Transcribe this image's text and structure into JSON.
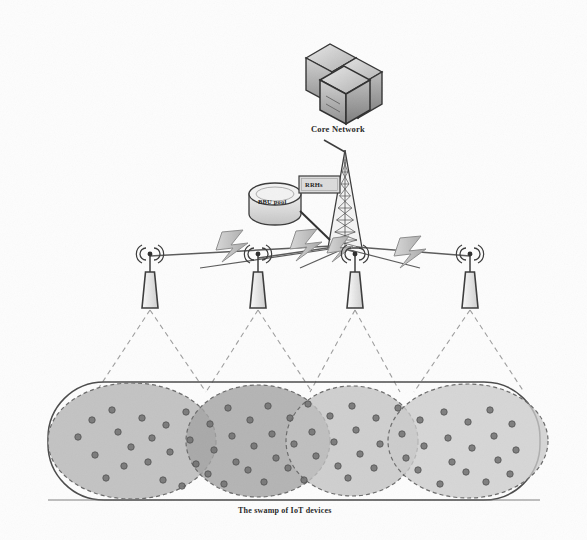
{
  "figure": {
    "kind": "network-architecture-diagram",
    "style": "scanned grayscale line art",
    "background_color": "#fdfdfd",
    "ink_color": "#3a3a3a"
  },
  "labels": {
    "core_network": "Core Network",
    "bbu_pool": "BBU pool",
    "rrhs": "RRHs",
    "swarm_caption": "The swamp of IoT devices"
  },
  "nodes": {
    "core_network": {
      "name": "core-network-servers",
      "x": 340,
      "y": 72,
      "icon": "server-cluster-icon"
    },
    "bbu_pool": {
      "name": "bbu-pool-cylinder",
      "cx": 275,
      "cy": 204,
      "rx": 26,
      "ry": 12,
      "icon": "database-cylinder-icon"
    },
    "rrhs_box": {
      "name": "rrhs-box",
      "x": 299,
      "y": 176,
      "w": 40,
      "h": 16,
      "icon": "rectangle-node-icon"
    },
    "tower": {
      "name": "lattice-tower",
      "apex_x": 345,
      "apex_y": 152,
      "base_y": 248,
      "base_half_width": 17
    }
  },
  "antennas": [
    {
      "name": "antenna-1",
      "x": 150,
      "y": 272
    },
    {
      "name": "antenna-2",
      "x": 258,
      "y": 272
    },
    {
      "name": "antenna-3",
      "x": 355,
      "y": 272
    },
    {
      "name": "antenna-4",
      "x": 470,
      "y": 272
    }
  ],
  "fronthaul_links": [
    {
      "name": "fronthaul-link-1",
      "from": "tower",
      "to": "antenna-1",
      "type": "wireless-lightning"
    },
    {
      "name": "fronthaul-link-2",
      "from": "tower",
      "to": "antenna-2",
      "type": "wireless-lightning"
    },
    {
      "name": "fronthaul-link-3",
      "from": "tower",
      "to": "antenna-3",
      "type": "wireless-lightning"
    },
    {
      "name": "fronthaul-link-4",
      "from": "tower",
      "to": "antenna-4",
      "type": "wireless-lightning"
    }
  ],
  "coverage_region": {
    "name": "iot-swarm-region",
    "shape": "rounded-rectangle",
    "x": 48,
    "y": 382,
    "w": 492,
    "h": 118,
    "radius": 56,
    "stroke": "#4a4a4a"
  },
  "coverage_cells": [
    {
      "name": "coverage-cell-1",
      "cx": 132,
      "cy": 441,
      "rx": 84,
      "ry": 58,
      "fill": "#b9b9b9"
    },
    {
      "name": "coverage-cell-2",
      "cx": 258,
      "cy": 441,
      "rx": 72,
      "ry": 56,
      "fill": "#a9a9a9"
    },
    {
      "name": "coverage-cell-3",
      "cx": 352,
      "cy": 441,
      "rx": 66,
      "ry": 55,
      "fill": "#c2c2c2"
    },
    {
      "name": "coverage-cell-4",
      "cx": 468,
      "cy": 441,
      "rx": 80,
      "ry": 57,
      "fill": "#cacaca"
    }
  ],
  "device_dots": {
    "name": "iot-device-dot",
    "color": "#6e6e6e",
    "radius": 3.2,
    "count": 58,
    "positions": [
      [
        78,
        437
      ],
      [
        95,
        455
      ],
      [
        92,
        420
      ],
      [
        112,
        410
      ],
      [
        118,
        432
      ],
      [
        131,
        447
      ],
      [
        124,
        466
      ],
      [
        106,
        478
      ],
      [
        142,
        418
      ],
      [
        152,
        438
      ],
      [
        148,
        462
      ],
      [
        166,
        425
      ],
      [
        170,
        452
      ],
      [
        163,
        480
      ],
      [
        186,
        412
      ],
      [
        190,
        440
      ],
      [
        196,
        464
      ],
      [
        182,
        486
      ],
      [
        210,
        424
      ],
      [
        214,
        450
      ],
      [
        208,
        474
      ],
      [
        228,
        408
      ],
      [
        232,
        436
      ],
      [
        236,
        462
      ],
      [
        224,
        484
      ],
      [
        250,
        420
      ],
      [
        254,
        446
      ],
      [
        248,
        470
      ],
      [
        268,
        406
      ],
      [
        272,
        434
      ],
      [
        276,
        458
      ],
      [
        264,
        482
      ],
      [
        290,
        418
      ],
      [
        294,
        444
      ],
      [
        288,
        468
      ],
      [
        308,
        404
      ],
      [
        312,
        432
      ],
      [
        316,
        456
      ],
      [
        304,
        480
      ],
      [
        330,
        416
      ],
      [
        334,
        442
      ],
      [
        338,
        466
      ],
      [
        352,
        406
      ],
      [
        356,
        430
      ],
      [
        360,
        454
      ],
      [
        348,
        478
      ],
      [
        376,
        418
      ],
      [
        380,
        444
      ],
      [
        374,
        468
      ],
      [
        398,
        408
      ],
      [
        402,
        434
      ],
      [
        406,
        458
      ],
      [
        420,
        420
      ],
      [
        424,
        446
      ],
      [
        418,
        470
      ],
      [
        444,
        412
      ],
      [
        448,
        438
      ],
      [
        452,
        462
      ],
      [
        440,
        484
      ],
      [
        468,
        422
      ],
      [
        472,
        448
      ],
      [
        466,
        472
      ],
      [
        490,
        410
      ],
      [
        494,
        436
      ],
      [
        498,
        460
      ],
      [
        486,
        482
      ],
      [
        512,
        424
      ],
      [
        516,
        450
      ],
      [
        510,
        474
      ]
    ]
  }
}
